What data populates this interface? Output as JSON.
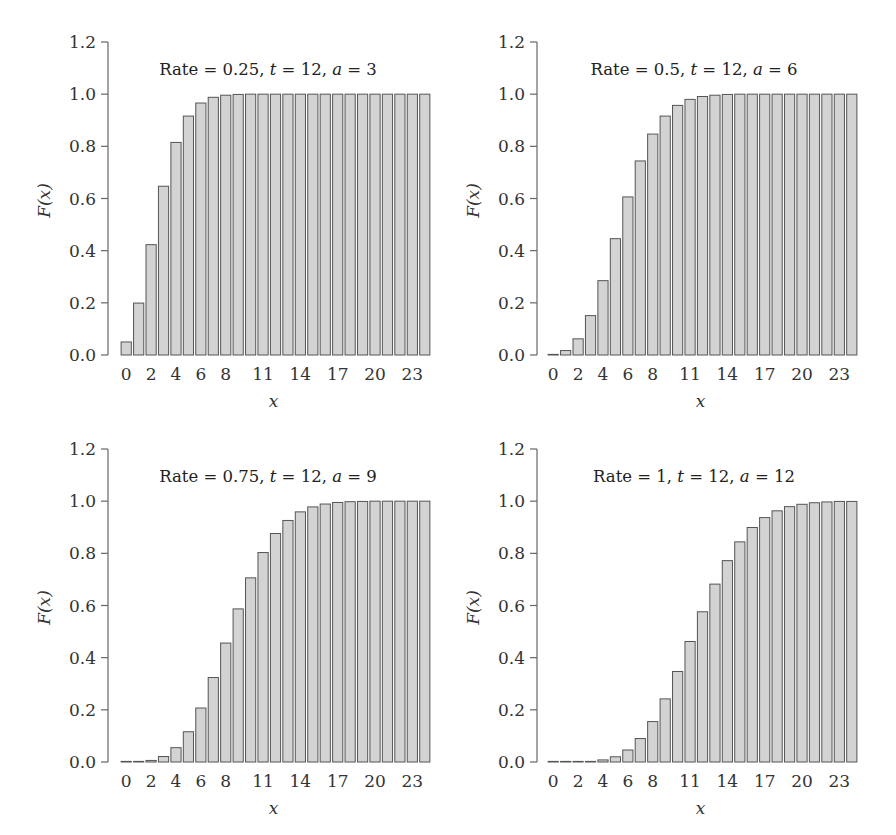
{
  "chart_data": [
    {
      "type": "bar",
      "title": "Rate = 0.25, t = 12, a = 3",
      "title_parts": {
        "prefix": "Rate = 0.25, ",
        "t_sym": "t",
        "t_val": " = 12, ",
        "a_sym": "a",
        "a_val": " = 3"
      },
      "xlabel": "x",
      "ylabel": "F(x)",
      "ylim": [
        0,
        1.2
      ],
      "yticks": [
        "0.0",
        "0.2",
        "0.4",
        "0.6",
        "0.8",
        "1.0",
        "1.2"
      ],
      "xticks": [
        "0",
        "2",
        "4",
        "6",
        "8",
        "11",
        "14",
        "17",
        "20",
        "23"
      ],
      "x": [
        0,
        1,
        2,
        3,
        4,
        5,
        6,
        7,
        8,
        9,
        10,
        11,
        12,
        13,
        14,
        15,
        16,
        17,
        18,
        19,
        20,
        21,
        22,
        23,
        24
      ],
      "values": [
        0.05,
        0.199,
        0.423,
        0.647,
        0.815,
        0.916,
        0.966,
        0.988,
        0.996,
        0.999,
        1.0,
        1.0,
        1.0,
        1.0,
        1.0,
        1.0,
        1.0,
        1.0,
        1.0,
        1.0,
        1.0,
        1.0,
        1.0,
        1.0,
        1.0
      ]
    },
    {
      "type": "bar",
      "title": "Rate = 0.5, t = 12, a = 6",
      "title_parts": {
        "prefix": "Rate = 0.5, ",
        "t_sym": "t",
        "t_val": " = 12, ",
        "a_sym": "a",
        "a_val": " = 6"
      },
      "xlabel": "x",
      "ylabel": "F(x)",
      "ylim": [
        0,
        1.2
      ],
      "yticks": [
        "0.0",
        "0.2",
        "0.4",
        "0.6",
        "0.8",
        "1.0",
        "1.2"
      ],
      "xticks": [
        "0",
        "2",
        "4",
        "6",
        "8",
        "11",
        "14",
        "17",
        "20",
        "23"
      ],
      "x": [
        0,
        1,
        2,
        3,
        4,
        5,
        6,
        7,
        8,
        9,
        10,
        11,
        12,
        13,
        14,
        15,
        16,
        17,
        18,
        19,
        20,
        21,
        22,
        23,
        24
      ],
      "values": [
        0.002,
        0.017,
        0.062,
        0.151,
        0.285,
        0.446,
        0.606,
        0.744,
        0.847,
        0.916,
        0.957,
        0.98,
        0.991,
        0.996,
        0.999,
        1.0,
        1.0,
        1.0,
        1.0,
        1.0,
        1.0,
        1.0,
        1.0,
        1.0,
        1.0
      ]
    },
    {
      "type": "bar",
      "title": "Rate = 0.75, t = 12, a = 9",
      "title_parts": {
        "prefix": "Rate = 0.75, ",
        "t_sym": "t",
        "t_val": " = 12, ",
        "a_sym": "a",
        "a_val": " = 9"
      },
      "xlabel": "x",
      "ylabel": "F(x)",
      "ylim": [
        0,
        1.2
      ],
      "yticks": [
        "0.0",
        "0.2",
        "0.4",
        "0.6",
        "0.8",
        "1.0",
        "1.2"
      ],
      "xticks": [
        "0",
        "2",
        "4",
        "6",
        "8",
        "11",
        "14",
        "17",
        "20",
        "23"
      ],
      "x": [
        0,
        1,
        2,
        3,
        4,
        5,
        6,
        7,
        8,
        9,
        10,
        11,
        12,
        13,
        14,
        15,
        16,
        17,
        18,
        19,
        20,
        21,
        22,
        23,
        24
      ],
      "values": [
        0.0,
        0.001,
        0.006,
        0.021,
        0.055,
        0.116,
        0.207,
        0.324,
        0.456,
        0.587,
        0.706,
        0.803,
        0.876,
        0.926,
        0.959,
        0.978,
        0.989,
        0.995,
        0.998,
        0.999,
        1.0,
        1.0,
        1.0,
        1.0,
        1.0
      ]
    },
    {
      "type": "bar",
      "title": "Rate = 1, t = 12, a = 12",
      "title_parts": {
        "prefix": "Rate = 1, ",
        "t_sym": "t",
        "t_val": " = 12, ",
        "a_sym": "a",
        "a_val": " = 12"
      },
      "xlabel": "x",
      "ylabel": "F(x)",
      "ylim": [
        0,
        1.2
      ],
      "yticks": [
        "0.0",
        "0.2",
        "0.4",
        "0.6",
        "0.8",
        "1.0",
        "1.2"
      ],
      "xticks": [
        "0",
        "2",
        "4",
        "6",
        "8",
        "11",
        "14",
        "17",
        "20",
        "23"
      ],
      "x": [
        0,
        1,
        2,
        3,
        4,
        5,
        6,
        7,
        8,
        9,
        10,
        11,
        12,
        13,
        14,
        15,
        16,
        17,
        18,
        19,
        20,
        21,
        22,
        23,
        24
      ],
      "values": [
        0.0,
        0.0,
        0.001,
        0.002,
        0.008,
        0.02,
        0.046,
        0.09,
        0.155,
        0.242,
        0.347,
        0.462,
        0.576,
        0.682,
        0.772,
        0.844,
        0.899,
        0.937,
        0.963,
        0.979,
        0.988,
        0.994,
        0.997,
        0.999,
        0.999
      ]
    }
  ],
  "colors": {
    "bar_fill": "#d3d3d3",
    "bar_stroke": "#555555",
    "axis": "#666666",
    "text": "#333333"
  }
}
